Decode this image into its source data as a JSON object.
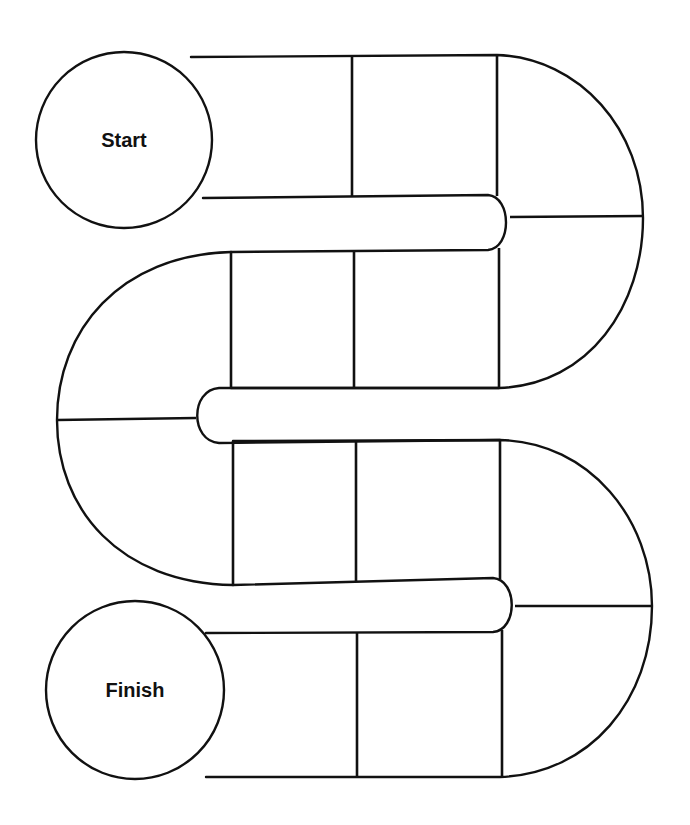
{
  "board": {
    "title": "Serpentine game board",
    "line_color": "#111111",
    "background": "#ffffff",
    "total_spaces": 15,
    "start": {
      "label": "Start",
      "cx": 124,
      "cy": 140,
      "r": 88
    },
    "finish": {
      "label": "Finish",
      "cx": 135,
      "cy": 690,
      "r": 89
    },
    "rows": [
      {
        "name": "row-1",
        "direction": "right",
        "dividers": [
          352,
          497
        ],
        "spaces": 3
      },
      {
        "name": "turn-right-1",
        "spaces": 2
      },
      {
        "name": "row-2",
        "direction": "left",
        "dividers": [
          354,
          231
        ],
        "spaces": 2
      },
      {
        "name": "turn-left",
        "spaces": 2
      },
      {
        "name": "row-3",
        "direction": "right",
        "dividers": [
          233,
          356,
          500
        ],
        "spaces": 2
      },
      {
        "name": "turn-right-2",
        "spaces": 2
      },
      {
        "name": "row-4",
        "direction": "left",
        "dividers": [
          356,
          500
        ],
        "spaces": 2
      }
    ],
    "paths": {
      "outer": "M 191 57 L 497 55 C 580 58 643 130 643 218 C 643 305 590 385 499 388 L 231 388 L 231 388 M 231 252 C 120 255 57 330 57 420 C 57 510 120 583 233 585 L 233 585 M 233 441 L 500 440 C 590 442 652 520 652 606 C 652 700 590 774 500 777 L 206 777",
      "inner": "M 203 198 L 488 195 C 512 197 512 248 488 250 L 231 252 M 499 388 L 219 388 C 190 390 190 441 219 443 L 500 440 M 233 585 L 493 578 C 518 580 518 630 493 632 L 206 633",
      "dividers": [
        "M 352 57 L 352 196",
        "M 497 55 L 497 196",
        "M 510 217 L 643 216",
        "M 231 252 L 231 388",
        "M 354 252 L 354 388",
        "M 499 248 L 499 388",
        "M 57 420 L 196 418",
        "M 233 441 L 233 585",
        "M 356 441 L 356 582",
        "M 500 440 L 500 579",
        "M 515 606 L 652 606",
        "M 357 633 L 357 777",
        "M 502 630 L 502 777"
      ]
    }
  }
}
